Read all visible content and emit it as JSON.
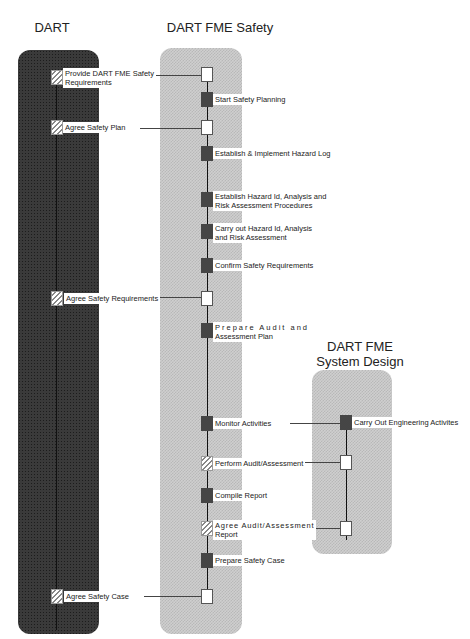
{
  "lanes": {
    "dart": {
      "title": "DART"
    },
    "safety": {
      "title": "DART FME Safety"
    },
    "design": {
      "title_line1": "DART FME",
      "title_line2": "System Design"
    }
  },
  "dart_activities": [
    {
      "label_line1": "Provide DART FME Safety",
      "label_line2": "Requirements",
      "style": "hatched"
    },
    {
      "label": "Agree Safety Plan",
      "style": "hatched"
    },
    {
      "label": "Agree Safety Requirements",
      "style": "hatched"
    },
    {
      "label": "Agree Safety Case",
      "style": "hatched"
    }
  ],
  "safety_activities": [
    {
      "label": "",
      "style": "white"
    },
    {
      "label": "Start Safety Planning",
      "style": "dark"
    },
    {
      "label": "",
      "style": "white"
    },
    {
      "label": "Establish & Implement Hazard Log",
      "style": "dark"
    },
    {
      "label_line1": "Establish Hazard Id, Analysis and",
      "label_line2": "Risk Assessment  Procedures",
      "style": "dark"
    },
    {
      "label_line1": "Carry out Hazard Id, Analysis",
      "label_line2": "and Risk Assessment",
      "style": "dark"
    },
    {
      "label": "Confirm Safety Requirements",
      "style": "dark"
    },
    {
      "label": "",
      "style": "white"
    },
    {
      "label_line1": "Prepare Audit and",
      "label_line2": "Assessment Plan",
      "style": "dark"
    },
    {
      "label": "Monitor Activities",
      "style": "dark"
    },
    {
      "label": "Perform Audit/Assessment",
      "style": "hatched"
    },
    {
      "label": "Compile Report",
      "style": "dark"
    },
    {
      "label_line1": "Agree  Audit/Assessment",
      "label_line2": "Report",
      "style": "hatched"
    },
    {
      "label": "Prepare Safety Case",
      "style": "dark"
    },
    {
      "label": "",
      "style": "white"
    }
  ],
  "design_activities": [
    {
      "label": "Carry Out Engineering Activites",
      "style": "dark"
    },
    {
      "label": "",
      "style": "white"
    },
    {
      "label": "",
      "style": "white"
    }
  ],
  "colors": {
    "dark_lane": "#3a3a3a",
    "light_lane": "#cfcfcf",
    "line": "#444444"
  }
}
